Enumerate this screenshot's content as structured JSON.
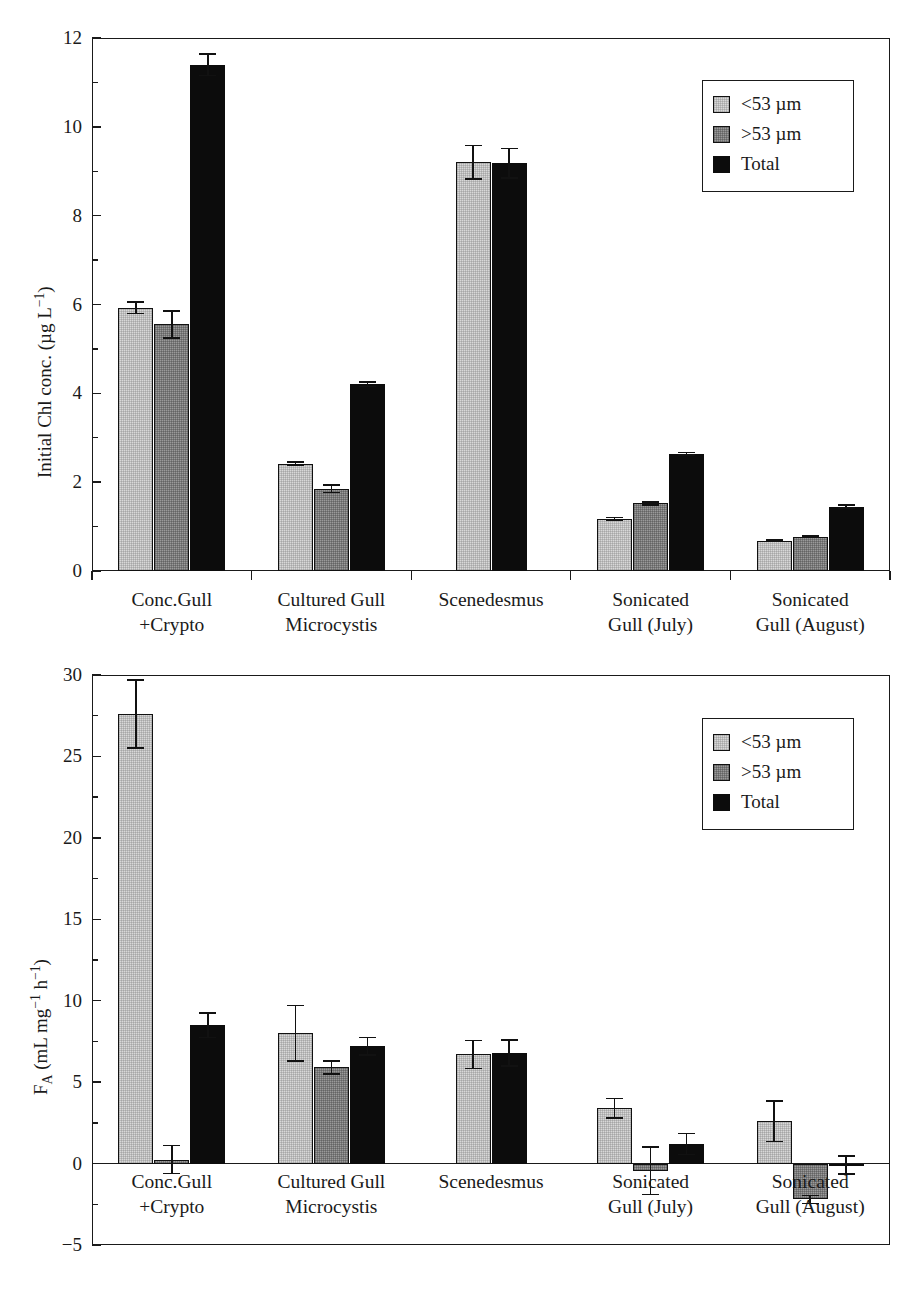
{
  "figure": {
    "background": "#ffffff",
    "series_colors": {
      "lt53": "#d8d8d8",
      "gt53": "#9a9a9a",
      "total": "#0c0c0c"
    }
  },
  "legend": {
    "items": [
      {
        "label": "<53 µm",
        "key": "lt53"
      },
      {
        "label": ">53 µm",
        "key": "gt53"
      },
      {
        "label": "Total",
        "key": "total"
      }
    ]
  },
  "categories": [
    {
      "line1": "Conc.Gull",
      "line2": "+Crypto"
    },
    {
      "line1": "Cultured Gull",
      "line2": "Microcystis"
    },
    {
      "line1": "Scenedesmus",
      "line2": ""
    },
    {
      "line1": "Sonicated",
      "line2": "Gull (July)"
    },
    {
      "line1": "Sonicated",
      "line2": "Gull (August)"
    }
  ],
  "chart_data": [
    {
      "type": "bar",
      "panel": "top",
      "title": "",
      "xlabel": "",
      "ylabel": "Initial Chl conc. (µg L⁻¹)",
      "ylim": [
        0,
        12
      ],
      "ytick_major": [
        0,
        2,
        4,
        6,
        8,
        10,
        12
      ],
      "ytick_minor": [
        1,
        3,
        5,
        7,
        9,
        11
      ],
      "ytick_labels": [
        "0",
        "2",
        "4",
        "6",
        "8",
        "10",
        "12"
      ],
      "grid": false,
      "legend_position": "top-right",
      "categories": [
        "Conc.Gull +Crypto",
        "Cultured Gull Microcystis",
        "Scenedesmus",
        "Sonicated Gull (July)",
        "Sonicated Gull (August)"
      ],
      "series": [
        {
          "name": "<53 µm",
          "values": [
            5.93,
            2.42,
            9.2,
            1.17,
            0.68
          ],
          "errors": [
            0.13,
            0.04,
            0.38,
            0.03,
            0.02
          ]
        },
        {
          "name": ">53 µm",
          "values": [
            5.55,
            1.85,
            null,
            1.52,
            0.77
          ],
          "errors": [
            0.3,
            0.08,
            null,
            0.03,
            0.02
          ]
        },
        {
          "name": "Total",
          "values": [
            11.4,
            4.2,
            9.18,
            2.64,
            1.45
          ],
          "errors": [
            0.24,
            0.05,
            0.33,
            0.03,
            0.03
          ]
        }
      ]
    },
    {
      "type": "bar",
      "panel": "bottom",
      "title": "",
      "xlabel": "",
      "ylabel": "F_A (mL mg⁻¹ h⁻¹)",
      "ylim": [
        -5,
        30
      ],
      "ytick_major": [
        -5,
        0,
        5,
        10,
        15,
        20,
        25,
        30
      ],
      "ytick_minor": [
        -2.5,
        2.5,
        7.5,
        12.5,
        17.5,
        22.5,
        27.5
      ],
      "ytick_labels": [
        "-5",
        "0",
        "5",
        "10",
        "15",
        "20",
        "25",
        "30"
      ],
      "grid": false,
      "legend_position": "top-right",
      "zero_line": 0,
      "categories": [
        "Conc.Gull +Crypto",
        "Cultured Gull Microcystis",
        "Scenedesmus",
        "Sonicated Gull (July)",
        "Sonicated Gull (August)"
      ],
      "series": [
        {
          "name": "<53 µm",
          "values": [
            27.6,
            8.0,
            6.7,
            3.4,
            2.6
          ],
          "errors": [
            2.1,
            1.7,
            0.85,
            0.6,
            1.25
          ]
        },
        {
          "name": ">53 µm",
          "values": [
            0.25,
            5.9,
            null,
            -0.45,
            -2.2
          ],
          "errors": [
            0.85,
            0.4,
            null,
            1.45,
            0.25
          ]
        },
        {
          "name": "Total",
          "values": [
            8.5,
            7.2,
            6.8,
            1.2,
            -0.08
          ],
          "errors": [
            0.75,
            0.55,
            0.8,
            0.65,
            0.55
          ]
        }
      ]
    }
  ]
}
